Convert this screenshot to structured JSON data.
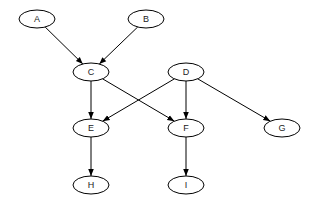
{
  "diagram": {
    "type": "directed-graph",
    "node_rx": 18,
    "node_ry": 9,
    "nodes": [
      {
        "id": "A",
        "label": "A",
        "x": 37,
        "y": 19
      },
      {
        "id": "B",
        "label": "B",
        "x": 146,
        "y": 19
      },
      {
        "id": "C",
        "label": "C",
        "x": 91,
        "y": 72
      },
      {
        "id": "D",
        "label": "D",
        "x": 186,
        "y": 72
      },
      {
        "id": "E",
        "label": "E",
        "x": 91,
        "y": 128
      },
      {
        "id": "F",
        "label": "F",
        "x": 186,
        "y": 128
      },
      {
        "id": "G",
        "label": "G",
        "x": 282,
        "y": 128
      },
      {
        "id": "H",
        "label": "H",
        "x": 91,
        "y": 185
      },
      {
        "id": "I",
        "label": "I",
        "x": 186,
        "y": 185
      }
    ],
    "edges": [
      {
        "from": "A",
        "to": "C"
      },
      {
        "from": "B",
        "to": "C"
      },
      {
        "from": "C",
        "to": "E"
      },
      {
        "from": "C",
        "to": "F"
      },
      {
        "from": "D",
        "to": "E"
      },
      {
        "from": "D",
        "to": "F"
      },
      {
        "from": "D",
        "to": "G"
      },
      {
        "from": "E",
        "to": "H"
      },
      {
        "from": "F",
        "to": "I"
      }
    ],
    "colors": {
      "stroke": "#000000",
      "fill": "#ffffff",
      "label": "#222222"
    }
  }
}
